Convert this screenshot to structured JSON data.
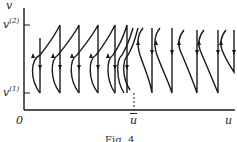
{
  "figure": {
    "y_axis_label": "v",
    "x_axis_label": "u",
    "origin_label": "0",
    "v2_label": "v",
    "v2_sup": "(2)",
    "v1_label": "v",
    "v1_sup": "(1)",
    "ubar_label": "u",
    "caption": "Fig. 4"
  },
  "colors": {
    "ink": "#1a1a1a",
    "background": "#ffffff"
  }
}
